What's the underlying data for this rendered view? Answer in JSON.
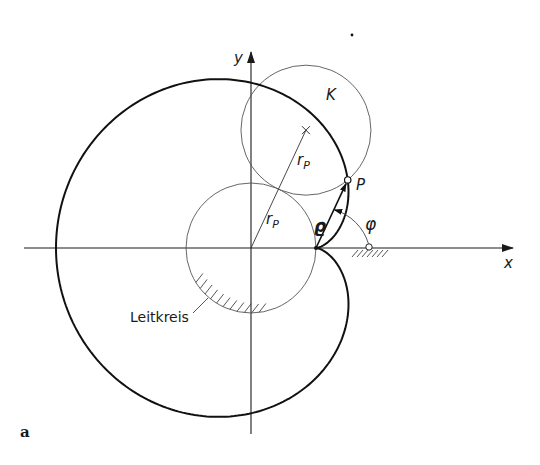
{
  "figure": {
    "width": 540,
    "height": 465,
    "panel_label": "a",
    "colors": {
      "curve": "#111111",
      "thin": "#555555",
      "axis": "#1a1a1a",
      "background": "#ffffff"
    },
    "geometry": {
      "origin": [
        251,
        248
      ],
      "radius_r": 65,
      "rolling_angle_deg": 65,
      "x_axis_range": [
        24,
        513
      ],
      "y_axis_range": [
        52,
        434
      ],
      "hinge_point": [
        369,
        247
      ],
      "stray_dot": [
        352,
        35
      ]
    }
  },
  "labels": {
    "x_axis": "x",
    "y_axis": "y",
    "rolling_circle": "K",
    "radius_upper": "r",
    "radius_upper_sub": "P",
    "radius_lower": "r",
    "radius_lower_sub": "P",
    "point": "P",
    "rho": "ϱ",
    "phi": "φ",
    "base_circle": "Leitkreis"
  },
  "chart_data": {
    "type": "diagram",
    "elements": [
      {
        "kind": "axis",
        "name": "x"
      },
      {
        "kind": "axis",
        "name": "y"
      },
      {
        "kind": "circle",
        "name": "Leitkreis",
        "center": [
          0,
          0
        ],
        "radius": "r_P"
      },
      {
        "kind": "circle",
        "name": "K",
        "center": "2 r_P at ~65°",
        "radius": "r_P"
      },
      {
        "kind": "curve",
        "name": "cardioid",
        "cusp": [
          1,
          0
        ],
        "extreme_left": [
          -3,
          0
        ],
        "units": "r_P"
      },
      {
        "kind": "point",
        "name": "P"
      },
      {
        "kind": "vector",
        "name": "ϱ",
        "from": "cusp",
        "to": "P"
      },
      {
        "kind": "angle",
        "name": "φ"
      }
    ]
  }
}
